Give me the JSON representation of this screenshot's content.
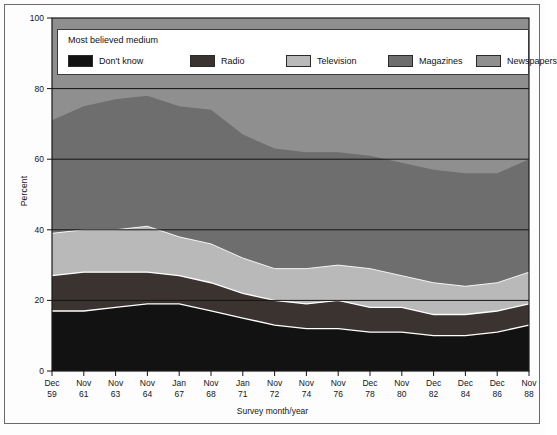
{
  "axes": {
    "ylabel": "Percent",
    "xlabel": "Survey month/year",
    "yticks": [
      "0",
      "20",
      "40",
      "60",
      "80",
      "100"
    ]
  },
  "legend": {
    "title": "Most believed medium",
    "items": [
      {
        "label": "Don't know",
        "color": "#121212",
        "name": "dont-know"
      },
      {
        "label": "Radio",
        "color": "#3b3330",
        "name": "radio"
      },
      {
        "label": "Television",
        "color": "#b9b9b9",
        "name": "television"
      },
      {
        "label": "Magazines",
        "color": "#6e6e6e",
        "name": "magazines"
      },
      {
        "label": "Newspapers",
        "color": "#8f8f8f",
        "name": "newspapers"
      }
    ]
  },
  "chart_data": {
    "type": "area",
    "title": "",
    "xlabel": "Survey month/year",
    "ylabel": "Percent",
    "ylim": [
      0,
      100
    ],
    "grid": true,
    "legend_position": "top-inside",
    "stacked": true,
    "categories": [
      "Dec 59",
      "Nov 61",
      "Nov 63",
      "Nov 64",
      "Jan 67",
      "Nov 68",
      "Jan 71",
      "Nov 72",
      "Nov 74",
      "Nov 76",
      "Dec 78",
      "Nov 80",
      "Dec 82",
      "Dec 84",
      "Dec 86",
      "Nov 88"
    ],
    "categories_month": [
      "Dec",
      "Nov",
      "Nov",
      "Nov",
      "Jan",
      "Nov",
      "Jan",
      "Nov",
      "Nov",
      "Nov",
      "Dec",
      "Nov",
      "Dec",
      "Dec",
      "Dec",
      "Nov"
    ],
    "categories_year": [
      "59",
      "61",
      "63",
      "64",
      "67",
      "68",
      "71",
      "72",
      "74",
      "76",
      "78",
      "80",
      "82",
      "84",
      "86",
      "88"
    ],
    "series": [
      {
        "name": "Don't know",
        "color": "#121212",
        "values": [
          17,
          17,
          18,
          19,
          19,
          17,
          15,
          13,
          12,
          12,
          11,
          11,
          10,
          10,
          11,
          13
        ]
      },
      {
        "name": "Radio",
        "color": "#3b3330",
        "values": [
          10,
          11,
          10,
          9,
          8,
          8,
          7,
          7,
          7,
          8,
          7,
          7,
          6,
          6,
          6,
          6
        ]
      },
      {
        "name": "Television",
        "color": "#b9b9b9",
        "values": [
          12,
          12,
          12,
          13,
          11,
          11,
          10,
          9,
          10,
          10,
          11,
          9,
          9,
          8,
          8,
          9
        ]
      },
      {
        "name": "Magazines",
        "color": "#6e6e6e",
        "values": [
          32,
          35,
          37,
          37,
          37,
          38,
          35,
          34,
          33,
          32,
          32,
          32,
          32,
          32,
          31,
          32
        ]
      },
      {
        "name": "Newspapers",
        "color": "#8f8f8f",
        "values": [
          29,
          25,
          23,
          22,
          25,
          26,
          33,
          37,
          38,
          38,
          39,
          41,
          43,
          44,
          44,
          40
        ]
      }
    ],
    "top_boundary_percent": [
      71,
      75,
      77,
      78,
      75,
      74,
      67,
      63,
      62,
      62,
      61,
      59,
      57,
      56,
      56,
      60
    ]
  }
}
